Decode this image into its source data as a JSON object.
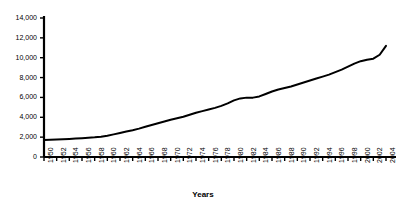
{
  "chart_data": {
    "type": "line",
    "title": "",
    "xlabel": "Years",
    "ylabel": "",
    "grid": false,
    "legend": "none",
    "xlim": [
      1950,
      2004
    ],
    "ylim": [
      0,
      14000
    ],
    "ytick_labels": [
      "14,000",
      "12,000",
      "10,000",
      "8,000",
      "6,000",
      "4,000",
      "2,000",
      "0"
    ],
    "ytick_values": [
      14000,
      12000,
      10000,
      8000,
      6000,
      4000,
      2000,
      0
    ],
    "xtick_labels": [
      "1950",
      "1952",
      "1954",
      "1956",
      "1958",
      "1960",
      "1962",
      "1964",
      "1966",
      "1968",
      "1970",
      "1972",
      "1974",
      "1976",
      "1978",
      "1980",
      "1982",
      "1984",
      "1986",
      "1988",
      "1990",
      "1992",
      "1994",
      "1996",
      "1998",
      "2000",
      "2002",
      "2004"
    ],
    "x": [
      1950,
      1951,
      1952,
      1953,
      1954,
      1955,
      1956,
      1957,
      1958,
      1959,
      1960,
      1961,
      1962,
      1963,
      1964,
      1965,
      1966,
      1967,
      1968,
      1969,
      1970,
      1971,
      1972,
      1973,
      1974,
      1975,
      1976,
      1977,
      1978,
      1979,
      1980,
      1981,
      1982,
      1983,
      1984,
      1985,
      1986,
      1987,
      1988,
      1989,
      1990,
      1991,
      1992,
      1993,
      1994,
      1995,
      1996,
      1997,
      1998,
      1999,
      2000,
      2001,
      2002,
      2003,
      2004
    ],
    "values": [
      1700,
      1730,
      1760,
      1790,
      1820,
      1860,
      1900,
      1940,
      1980,
      2050,
      2150,
      2280,
      2420,
      2560,
      2700,
      2860,
      3040,
      3220,
      3400,
      3580,
      3760,
      3900,
      4050,
      4250,
      4450,
      4620,
      4780,
      4950,
      5150,
      5400,
      5700,
      5900,
      5980,
      5980,
      6100,
      6350,
      6600,
      6800,
      6950,
      7100,
      7300,
      7500,
      7700,
      7900,
      8100,
      8300,
      8550,
      8800,
      9100,
      9400,
      9650,
      9800,
      9900,
      10300,
      11200
    ],
    "series": [
      {
        "name": "",
        "color": "#000000",
        "values": [
          1700,
          1730,
          1760,
          1790,
          1820,
          1860,
          1900,
          1940,
          1980,
          2050,
          2150,
          2280,
          2420,
          2560,
          2700,
          2860,
          3040,
          3220,
          3400,
          3580,
          3760,
          3900,
          4050,
          4250,
          4450,
          4620,
          4780,
          4950,
          5150,
          5400,
          5700,
          5900,
          5980,
          5980,
          6100,
          6350,
          6600,
          6800,
          6950,
          7100,
          7300,
          7500,
          7700,
          7900,
          8100,
          8300,
          8550,
          8800,
          9100,
          9400,
          9650,
          9800,
          9900,
          10300,
          11200
        ]
      }
    ],
    "colors": {
      "line": "#000000",
      "axis": "#000000",
      "background": "#ffffff"
    }
  }
}
